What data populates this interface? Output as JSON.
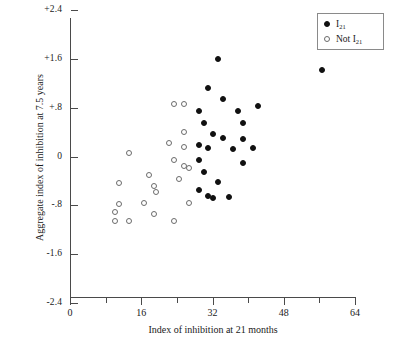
{
  "chart_data": {
    "type": "scatter",
    "title": "",
    "xlabel": "Index of inhibition at 21 months",
    "ylabel": "Aggregate index of inhibition at 7.5 years",
    "xlim": [
      0,
      64
    ],
    "ylim": [
      -2.4,
      2.4
    ],
    "grid": false,
    "legend_position": "top-right",
    "x_ticks": [
      0,
      16,
      32,
      48,
      64
    ],
    "x_tick_labels": [
      "0",
      "16",
      "32",
      "48",
      "64"
    ],
    "x_minor_ticks": [
      8,
      24,
      40,
      56
    ],
    "y_ticks": [
      2.4,
      1.6,
      0.8,
      0,
      -0.8,
      -1.6,
      -2.4
    ],
    "y_tick_labels": [
      "+2.4",
      "+1.6",
      "+.8",
      "0",
      "-.8",
      "-1.6",
      "-2.4"
    ],
    "series": [
      {
        "name": "I21",
        "label_text": "I",
        "label_sub": "21",
        "marker": "filled-circle",
        "color": "#111111",
        "points": [
          [
            33.3,
            1.6
          ],
          [
            31.1,
            1.12
          ],
          [
            34.4,
            0.94
          ],
          [
            28.9,
            0.74
          ],
          [
            37.8,
            0.74
          ],
          [
            42.2,
            0.82
          ],
          [
            30.0,
            0.54
          ],
          [
            38.9,
            0.54
          ],
          [
            32.2,
            0.36
          ],
          [
            34.4,
            0.3
          ],
          [
            38.9,
            0.28
          ],
          [
            28.9,
            0.18
          ],
          [
            31.1,
            0.14
          ],
          [
            36.7,
            0.12
          ],
          [
            41.1,
            0.14
          ],
          [
            28.9,
            -0.06
          ],
          [
            38.9,
            -0.1
          ],
          [
            30.0,
            -0.26
          ],
          [
            33.3,
            -0.42
          ],
          [
            28.9,
            -0.54
          ],
          [
            31.1,
            -0.64
          ],
          [
            32.2,
            -0.68
          ],
          [
            35.6,
            -0.66
          ],
          [
            56.7,
            1.42
          ]
        ]
      },
      {
        "name": "Not I21",
        "label_text": "Not I",
        "label_sub": "21",
        "marker": "open-circle",
        "color": "#6b6b6b",
        "points": [
          [
            23.3,
            0.86
          ],
          [
            25.6,
            0.86
          ],
          [
            25.6,
            0.4
          ],
          [
            22.2,
            0.22
          ],
          [
            25.6,
            0.16
          ],
          [
            13.3,
            0.06
          ],
          [
            23.3,
            -0.06
          ],
          [
            25.6,
            -0.16
          ],
          [
            26.7,
            -0.18
          ],
          [
            17.8,
            -0.3
          ],
          [
            24.4,
            -0.36
          ],
          [
            11.1,
            -0.44
          ],
          [
            18.9,
            -0.48
          ],
          [
            19.4,
            -0.58
          ],
          [
            11.1,
            -0.78
          ],
          [
            16.7,
            -0.76
          ],
          [
            26.7,
            -0.76
          ],
          [
            10.0,
            -0.9
          ],
          [
            18.9,
            -0.94
          ],
          [
            10.0,
            -1.06
          ],
          [
            13.3,
            -1.06
          ],
          [
            23.3,
            -1.06
          ]
        ]
      }
    ]
  },
  "legend": {
    "entries": [
      {
        "marker": "filled-circle",
        "text": "I",
        "sub": "21"
      },
      {
        "marker": "open-circle",
        "text": "Not I",
        "sub": "21"
      }
    ]
  }
}
